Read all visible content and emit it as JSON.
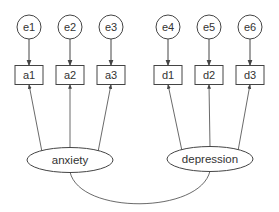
{
  "diagram": {
    "type": "structural-equation-model",
    "errors": [
      {
        "id": "e1",
        "label": "e1",
        "cx": 29,
        "cy": 27
      },
      {
        "id": "e2",
        "label": "e2",
        "cx": 70,
        "cy": 27
      },
      {
        "id": "e3",
        "label": "e3",
        "cx": 111,
        "cy": 27
      },
      {
        "id": "e4",
        "label": "e4",
        "cx": 168,
        "cy": 27
      },
      {
        "id": "e5",
        "label": "e5",
        "cx": 209,
        "cy": 27
      },
      {
        "id": "e6",
        "label": "e6",
        "cx": 250,
        "cy": 27
      }
    ],
    "indicators": [
      {
        "id": "a1",
        "label": "a1",
        "cx": 29,
        "cy": 75
      },
      {
        "id": "a2",
        "label": "a2",
        "cx": 70,
        "cy": 75
      },
      {
        "id": "a3",
        "label": "a3",
        "cx": 111,
        "cy": 75
      },
      {
        "id": "d1",
        "label": "d1",
        "cx": 168,
        "cy": 75
      },
      {
        "id": "d2",
        "label": "d2",
        "cx": 209,
        "cy": 75
      },
      {
        "id": "d3",
        "label": "d3",
        "cx": 250,
        "cy": 75
      }
    ],
    "latents": [
      {
        "id": "anxiety",
        "label": "anxiety",
        "cx": 70,
        "cy": 160
      },
      {
        "id": "depression",
        "label": "depression",
        "cx": 210,
        "cy": 159
      }
    ],
    "covariance": {
      "from": "anxiety",
      "to": "depression"
    },
    "colors": {
      "stroke": "#444444",
      "text": "#333333",
      "background": "#ffffff"
    }
  }
}
